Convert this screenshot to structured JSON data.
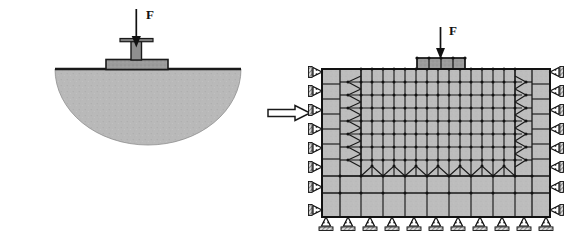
{
  "figure": {
    "background_color": "#ffffff",
    "soil_fill": "#b9b9b9",
    "line_color": "#1a1a1a",
    "footing_fill": "#9a9a9a"
  },
  "left_panel": {
    "name": "physical-model",
    "load_label": "F",
    "ground_line": {
      "x1": 55,
      "x2": 241,
      "y": 69
    },
    "soil_bulb": {
      "cx": 148,
      "cy": 69,
      "rx": 93,
      "ry": 76,
      "shape": "half-ellipse"
    },
    "footing": {
      "x": 106,
      "y": 60,
      "width": 62,
      "height": 10
    },
    "column": {
      "x": 131,
      "y": 40,
      "width": 11,
      "height": 20
    },
    "cap_plate": {
      "x": 120,
      "y": 38,
      "width": 33,
      "height": 3
    },
    "load_arrow": {
      "x": 136,
      "y_top": 8,
      "y_bottom": 44
    }
  },
  "transition_arrow": {
    "name": "transform-arrow",
    "x": 268,
    "y": 113,
    "length": 42,
    "head": 13,
    "direction": "right"
  },
  "right_panel": {
    "name": "fem-mesh-model",
    "load_label": "F",
    "domain": {
      "x": 322,
      "y": 69,
      "width": 228,
      "height": 148
    },
    "load_arrow": {
      "x": 440,
      "y_top": 26,
      "y_bottom": 62
    },
    "footing_block": {
      "x": 417,
      "y": 58,
      "width": 48,
      "height": 11
    },
    "mesh": {
      "fine_cols": 16,
      "fine_rows": 8,
      "coarse_band_left": 1,
      "coarse_band_right": 1,
      "coarse_band_bottom": 2,
      "has_midside_nodes": true,
      "transition_style": "chevron"
    },
    "supports": {
      "left_rollers": 8,
      "right_rollers": 8,
      "bottom_rollers": 11,
      "left_type": "horizontal-roller",
      "right_type": "horizontal-roller",
      "bottom_type": "vertical-roller"
    }
  }
}
